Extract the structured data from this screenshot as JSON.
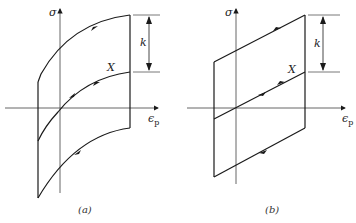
{
  "figure": {
    "panels": [
      {
        "id": "a",
        "caption": "(a)",
        "y_axis_label": "σ",
        "x_axis_label": "ϵ",
        "x_axis_subscript": "p",
        "gap_label": "k",
        "curve_label": "X",
        "description": "Nonlinear kinematic hardening: curved stress-strain loops"
      },
      {
        "id": "b",
        "caption": "(b)",
        "y_axis_label": "σ",
        "x_axis_label": "ϵ",
        "x_axis_subscript": "p",
        "gap_label": "k",
        "curve_label": "X",
        "description": "Linear kinematic hardening: parallelogram stress-strain loop"
      }
    ],
    "colors": {
      "line": "#1a1a1a",
      "axis": "#555555",
      "background": "#ffffff"
    }
  }
}
